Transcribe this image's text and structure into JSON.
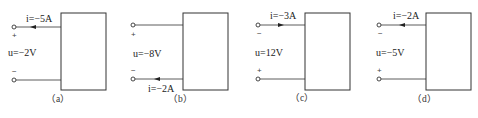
{
  "diagram": {
    "type": "circuit-element-reference-directions",
    "panels": [
      {
        "caption": "（a）",
        "current_label": "i=−5A",
        "current_position": "top",
        "current_arrow": "left",
        "voltage_label": "u=−2V",
        "top_sign": "+",
        "bottom_sign": "−"
      },
      {
        "caption": "（b）",
        "current_label": "i=−2A",
        "current_position": "bottom",
        "current_arrow": "left",
        "voltage_label": "u=−8V",
        "top_sign": "+",
        "bottom_sign": "−"
      },
      {
        "caption": "（c）",
        "current_label": "i=−3A",
        "current_position": "top",
        "current_arrow": "right",
        "voltage_label": "u=12V",
        "top_sign": "−",
        "bottom_sign": "+"
      },
      {
        "caption": "（d）",
        "current_label": "i=−2A",
        "current_position": "top",
        "current_arrow": "left",
        "voltage_label": "u=−5V",
        "top_sign": "−",
        "bottom_sign": "+"
      }
    ]
  }
}
